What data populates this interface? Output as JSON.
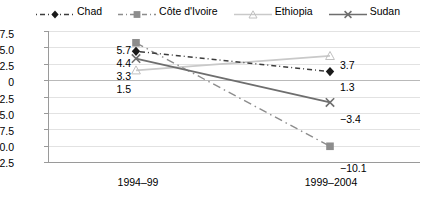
{
  "chart_data": {
    "type": "line",
    "title": "",
    "xlabel": "",
    "ylabel": "",
    "categories": [
      "1994–99",
      "1999–2004"
    ],
    "ylim": [
      -12.5,
      7.5
    ],
    "yticks": [
      "7.5",
      "5.0",
      "2.5",
      "0",
      "−2.5",
      "−5.0",
      "−7.5",
      "−10.0",
      "−12.5"
    ],
    "ytick_values": [
      7.5,
      5.0,
      2.5,
      0,
      -2.5,
      -5.0,
      -7.5,
      -10.0,
      -12.5
    ],
    "grid": true,
    "legend_position": "top",
    "series": [
      {
        "name": "Chad",
        "values": [
          4.4,
          1.3
        ],
        "labels": [
          "4.4",
          "1.3"
        ],
        "color": "#3c3c3c",
        "marker": "diamond",
        "dash": "dash-dot"
      },
      {
        "name": "Côte d'Ivoire",
        "values": [
          5.7,
          -10.1
        ],
        "labels": [
          "5.7",
          "−10.1"
        ],
        "color": "#8d8d8d",
        "marker": "square",
        "dash": "dash-dot-long"
      },
      {
        "name": "Ethiopia",
        "values": [
          1.5,
          3.7
        ],
        "labels": [
          "1.5",
          "3.7"
        ],
        "color": "#c9c9c9",
        "marker": "triangle",
        "dash": "solid"
      },
      {
        "name": "Sudan",
        "values": [
          3.3,
          -3.4
        ],
        "labels": [
          "3.3",
          "−3.4"
        ],
        "color": "#6e6e6e",
        "marker": "cross",
        "dash": "solid"
      }
    ]
  },
  "legend": {
    "items": [
      {
        "label": "Chad",
        "icon": "diamond-marker-icon"
      },
      {
        "label": "Côte d'Ivoire",
        "icon": "square-marker-icon"
      },
      {
        "label": "Ethiopia",
        "icon": "triangle-marker-icon"
      },
      {
        "label": "Sudan",
        "icon": "cross-marker-icon"
      }
    ]
  }
}
